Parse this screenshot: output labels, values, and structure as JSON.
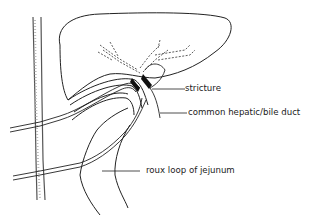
{
  "diagram": {
    "type": "anatomical-line-drawing",
    "labels": [
      {
        "id": "stricture",
        "text": "stricture"
      },
      {
        "id": "common-hepatic-bile-duct",
        "text": "common hepatic/bile duct"
      },
      {
        "id": "roux-loop",
        "text": "roux loop of jejunum"
      }
    ],
    "colors": {
      "background": "#ffffff",
      "line": "#222222",
      "stricture_fill": "#111111",
      "tube_stipple": "#bbbbbb"
    }
  }
}
